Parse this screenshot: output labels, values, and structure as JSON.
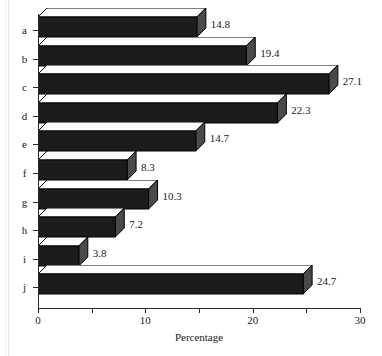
{
  "chart_data": {
    "type": "bar",
    "orientation": "horizontal",
    "title": "",
    "subtitle": "",
    "xlabel": "Percentage",
    "ylabel": "",
    "categories": [
      "a",
      "b",
      "c",
      "d",
      "e",
      "f",
      "g",
      "h",
      "i",
      "j"
    ],
    "values": [
      14.8,
      19.4,
      27.1,
      22.3,
      14.7,
      8.3,
      10.3,
      7.2,
      3.8,
      24.7
    ],
    "data_labels": [
      "14.8",
      "19.4",
      "27.1",
      "22.3",
      "14.7",
      "8.3",
      "10.3",
      "7.2",
      "3.8",
      "24.7"
    ],
    "xlim": [
      0,
      30
    ],
    "xticks": [
      0,
      5,
      10,
      15,
      20,
      25,
      30
    ],
    "xtick_labels": [
      "0",
      "",
      "10",
      "",
      "20",
      "",
      "30"
    ],
    "grid": false,
    "legend": null,
    "style": "3d-bars",
    "colors": {
      "bar_front": "#1c1c1c",
      "bar_top": "#fdfdfd",
      "bar_cap": "#4a4a4a",
      "axis": "#2a2a2a",
      "text": "#1a1a1a",
      "background": "#ffffff"
    }
  }
}
